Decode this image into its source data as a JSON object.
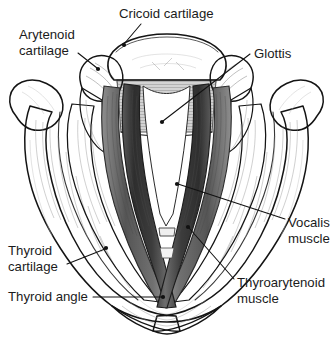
{
  "figure": {
    "background_color": "#ffffff",
    "text_color": "#1b1b1b",
    "leader_color": "#111111",
    "width": 333,
    "height": 337
  },
  "labels": [
    {
      "id": "cricoid-cartilage",
      "lines": [
        "Cricoid cartilage"
      ],
      "text": "Cricoid cartilage",
      "text_x": 119,
      "text_y": 18,
      "anchor": "start",
      "leader": "M 141 24 L 124 44",
      "dot_x": 124,
      "dot_y": 45
    },
    {
      "id": "arytenoid-cartilage",
      "lines": [
        "Arytenoid",
        "cartilage"
      ],
      "text": "Arytenoid cartilage",
      "text_x": 19,
      "text_y": 39,
      "anchor": "start",
      "leader": "M 78 53 L 97 68",
      "dot_x": 98,
      "dot_y": 69
    },
    {
      "id": "glottis",
      "lines": [
        "Glottis"
      ],
      "text": "Glottis",
      "text_x": 254,
      "text_y": 58,
      "anchor": "start",
      "leader": "M 250 54 L 163 121",
      "dot_x": 162,
      "dot_y": 122
    },
    {
      "id": "vocalis-muscle",
      "lines": [
        "Vocalis",
        "muscle"
      ],
      "text": "Vocalis muscle",
      "text_x": 288,
      "text_y": 227,
      "anchor": "start",
      "leader": "M 285 219 L 178 184",
      "dot_x": 177,
      "dot_y": 184
    },
    {
      "id": "thyroarytenoid-muscle",
      "lines": [
        "Thyroarytenoid",
        "muscle"
      ],
      "text": "Thyroarytenoid muscle",
      "text_x": 237,
      "text_y": 287,
      "anchor": "start",
      "leader": "M 234 279 L 189 228",
      "dot_x": 188,
      "dot_y": 227
    },
    {
      "id": "thyroid-cartilage",
      "lines": [
        "Thyroid",
        "cartilage"
      ],
      "text": "Thyroid cartilage",
      "text_x": 8,
      "text_y": 255,
      "anchor": "start",
      "leader": "M 67 264 L 105 249",
      "dot_x": 106,
      "dot_y": 248
    },
    {
      "id": "thyroid-angle",
      "lines": [
        "Thyroid angle"
      ],
      "text": "Thyroid angle",
      "text_x": 8,
      "text_y": 301,
      "anchor": "start",
      "leader": "M 93 297 L 162 297",
      "dot_x": 163,
      "dot_y": 297
    }
  ],
  "structures": [
    {
      "id": "cricoid-arch",
      "name": "Cricoid cartilage arch",
      "shading": "light-gray"
    },
    {
      "id": "arytenoid-left",
      "name": "Left arytenoid cartilage",
      "shading": "light-gray"
    },
    {
      "id": "arytenoid-right",
      "name": "Right arytenoid cartilage",
      "shading": "light-gray"
    },
    {
      "id": "thyroid-lamina-left",
      "name": "Left thyroid lamina",
      "shading": "pale-gray"
    },
    {
      "id": "thyroid-lamina-right",
      "name": "Right thyroid lamina",
      "shading": "pale-gray"
    },
    {
      "id": "superior-cornu-left",
      "name": "Left superior cornu",
      "shading": "pale-gray"
    },
    {
      "id": "superior-cornu-right",
      "name": "Right superior cornu",
      "shading": "pale-gray"
    },
    {
      "id": "vocal-fold-left",
      "name": "Left vocal fold / vocalis muscle",
      "shading": "dark-gray"
    },
    {
      "id": "vocal-fold-right",
      "name": "Right vocal fold / vocalis muscle",
      "shading": "dark-gray"
    },
    {
      "id": "thyroarytenoid-left",
      "name": "Left thyroarytenoid muscle",
      "shading": "mid-gray"
    },
    {
      "id": "thyroarytenoid-right",
      "name": "Right thyroarytenoid muscle",
      "shading": "mid-gray"
    },
    {
      "id": "glottis-aperture",
      "name": "Glottis (rima glottidis)",
      "shading": "white"
    }
  ]
}
